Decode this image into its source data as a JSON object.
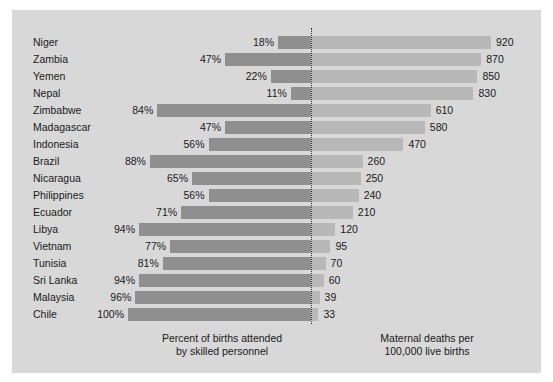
{
  "chart_data": {
    "type": "bar",
    "subtype": "diverging-bidirectional-bar",
    "title": "",
    "categories": [
      "Niger",
      "Zambia",
      "Yemen",
      "Nepal",
      "Zimbabwe",
      "Madagascar",
      "Indonesia",
      "Brazil",
      "Nicaragua",
      "Philippines",
      "Ecuador",
      "Libya",
      "Vietnam",
      "Tunisia",
      "Sri Lanka",
      "Malaysia",
      "Chile"
    ],
    "series": [
      {
        "name": "Percent of births attended by skilled personnel",
        "side": "left",
        "unit": "%",
        "color": "#8f8f8f",
        "axis_max": 100,
        "values": [
          18,
          47,
          22,
          11,
          84,
          47,
          56,
          88,
          65,
          56,
          71,
          94,
          77,
          81,
          94,
          96,
          100
        ],
        "labels": [
          "18%",
          "47%",
          "22%",
          "11%",
          "84%",
          "47%",
          "56%",
          "88%",
          "65%",
          "56%",
          "71%",
          "94%",
          "77%",
          "81%",
          "94%",
          "96%",
          "100%"
        ]
      },
      {
        "name": "Maternal deaths per 100,000 live births",
        "side": "right",
        "unit": "",
        "color": "#b8b8b8",
        "axis_max": 920,
        "values": [
          920,
          870,
          850,
          830,
          610,
          580,
          470,
          260,
          250,
          240,
          210,
          120,
          95,
          70,
          60,
          39,
          33
        ],
        "labels": [
          "920",
          "870",
          "850",
          "830",
          "610",
          "580",
          "470",
          "260",
          "250",
          "240",
          "210",
          "120",
          "95",
          "70",
          "60",
          "39",
          "33"
        ]
      }
    ],
    "xlabel": "",
    "ylabel": "",
    "grid": false,
    "legend_position": "bottom",
    "center_divider": true
  },
  "captions": {
    "left_line1": "Percent of births attended",
    "left_line2": "by skilled personnel",
    "right_line1": "Maternal deaths per",
    "right_line2": "100,000 live births"
  },
  "colors": {
    "background": "#d8d8d8",
    "left_bar": "#8f8f8f",
    "right_bar": "#b8b8b8",
    "text": "#1a1a1a",
    "divider": "#2a2a2a"
  }
}
